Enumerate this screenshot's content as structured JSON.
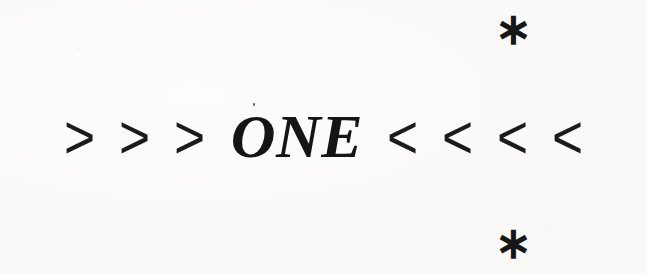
{
  "page": {
    "kind": "scanned-page-fragment",
    "background_color": "#fdfdfc",
    "ink_color": "#171717",
    "width": 647,
    "height": 273
  },
  "ornament": {
    "chevrons_left": [
      ">",
      ">",
      ">"
    ],
    "word": "ONE",
    "chevrons_right": [
      "<",
      "<",
      "<",
      "<"
    ],
    "full_line": "> > > ONE < < < <"
  },
  "marks": {
    "asterisk_top": "∗",
    "asterisk_bottom": "∗"
  }
}
